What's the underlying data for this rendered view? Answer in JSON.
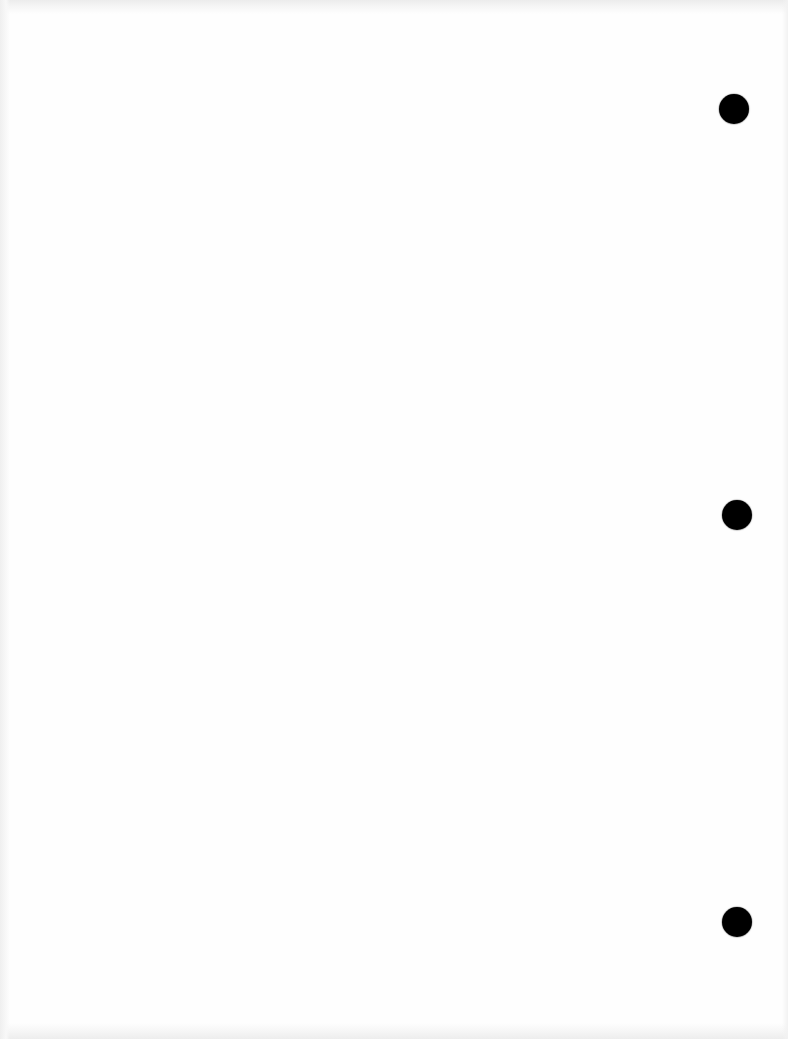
{
  "document": {
    "type": "scanned-blank-page",
    "background_color": "#fefefe",
    "text_content": "",
    "punch_holes": [
      {
        "cx": 734,
        "cy": 109,
        "r": 15,
        "color": "#000000"
      },
      {
        "cx": 737,
        "cy": 515,
        "r": 15,
        "color": "#000000"
      },
      {
        "cx": 737,
        "cy": 922,
        "r": 15,
        "color": "#000000"
      }
    ]
  }
}
